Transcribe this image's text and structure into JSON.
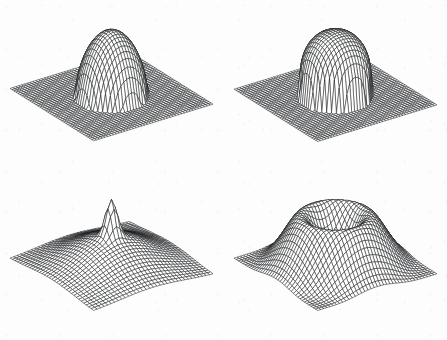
{
  "figure": {
    "title": "",
    "background_color": "#fdfdfd",
    "line_color": "#17181a",
    "layout": "2x2-grid",
    "panel_count": 4
  },
  "chart_data": [
    {
      "type": "surface",
      "panel_index": 0,
      "panel_position": "top-left",
      "name": "smooth-dome",
      "description": "Smooth rounded dome (bump) rising from a flat square base plane; circular footprint, hemispherical cap, gentle shoulder, surface returns exactly to zero outside the support radius.",
      "title": "",
      "xlabel": "",
      "ylabel": "",
      "zlabel": "",
      "grid": true,
      "legend": "none",
      "mesh": {
        "nx": 42,
        "ny": 42
      },
      "xlim": [
        -1,
        1
      ],
      "ylim": [
        -1,
        1
      ],
      "zlim": [
        0,
        1
      ],
      "view": {
        "azimuth": -55,
        "elevation": 26
      },
      "surface_model": {
        "kind": "compact-bump",
        "formula": "z = (1 - (r/R)^2)^p for r < R else 0",
        "R": 0.5,
        "p": 0.6,
        "amplitude": 1.0,
        "center": [
          0.0,
          0.0
        ]
      },
      "z_peak": 1.0,
      "z_base": 0.0,
      "support_radius": 0.5
    },
    {
      "type": "surface",
      "panel_index": 1,
      "panel_position": "top-right",
      "name": "steep-plateau-dome",
      "description": "Taller dome with steeper, nearly vertical sides and a flatter, slightly peaked plateau top; same flat square base plane, circular footprint with a sharper shoulder break than the top-left panel.",
      "title": "",
      "xlabel": "",
      "ylabel": "",
      "zlabel": "",
      "grid": true,
      "legend": "none",
      "mesh": {
        "nx": 42,
        "ny": 42
      },
      "xlim": [
        -1,
        1
      ],
      "ylim": [
        -1,
        1
      ],
      "zlim": [
        0,
        1.25
      ],
      "view": {
        "azimuth": -55,
        "elevation": 26
      },
      "surface_model": {
        "kind": "compact-bump",
        "formula": "z = (1 - (r/R)^2)^p for r < R else 0",
        "R": 0.5,
        "p": 0.3,
        "amplitude": 1.25,
        "center": [
          0.0,
          0.0
        ]
      },
      "z_peak": 1.25,
      "z_base": 0.0,
      "support_radius": 0.5
    },
    {
      "type": "surface",
      "panel_index": 2,
      "panel_position": "bottom-left",
      "name": "broad-mound-with-spike",
      "description": "Broad shallow mound covering the whole domain with a narrow sharp spike at the centre; edges of the mesh curl gently upward, no flat surrounding plane.",
      "title": "",
      "xlabel": "",
      "ylabel": "",
      "zlabel": "",
      "grid": true,
      "legend": "none",
      "mesh": {
        "nx": 34,
        "ny": 34
      },
      "xlim": [
        -1,
        1
      ],
      "ylim": [
        -1,
        1
      ],
      "zlim": [
        0,
        0.62
      ],
      "view": {
        "azimuth": -55,
        "elevation": 26
      },
      "surface_model": {
        "kind": "broad-mound-plus-narrow-spike",
        "formula": "z = a*exp(-(r/s1)^2) + b*exp(-(r/s2)^2)",
        "a": 0.3,
        "s1": 0.78,
        "b": 0.34,
        "s2": 0.115,
        "center": [
          0.0,
          0.0
        ]
      },
      "z_peak": 0.62,
      "z_base": 0.0,
      "spike_width": 0.115
    },
    {
      "type": "surface",
      "panel_index": 3,
      "panel_position": "bottom-right",
      "name": "crater-volcano",
      "description": "Volcano / crater shape: a raised circular rim ring with a smooth central depression sinking below the rim, sitting on a broad raised pedestal whose edges fall off steeply to the domain boundary.",
      "title": "",
      "xlabel": "",
      "ylabel": "",
      "zlabel": "",
      "grid": true,
      "legend": "none",
      "mesh": {
        "nx": 38,
        "ny": 38
      },
      "xlim": [
        -1,
        1
      ],
      "ylim": [
        -1,
        1
      ],
      "zlim": [
        0,
        1.0
      ],
      "view": {
        "azimuth": -55,
        "elevation": 26
      },
      "surface_model": {
        "kind": "annular-crater",
        "formula": "z = base(r) + rim*exp(-((r-r0)/w)^2) - dip*exp(-(r/d)^2)",
        "base_plateau": 0.42,
        "rim_height": 0.4,
        "rim_radius": 0.46,
        "rim_width": 0.26,
        "dip_depth": 0.34,
        "dip_width": 0.32,
        "center": [
          0.0,
          0.0
        ]
      },
      "z_peak": 1.0,
      "z_crater_floor": 0.52,
      "rim_radius": 0.46
    }
  ]
}
